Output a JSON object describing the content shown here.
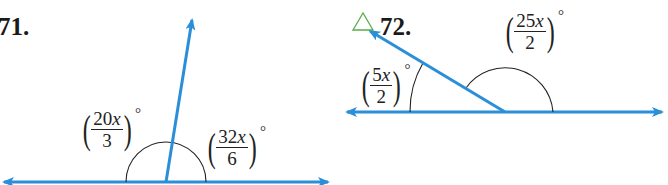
{
  "problems": [
    {
      "number": "71.",
      "flag_icon": "",
      "angles": [
        {
          "numerator_coef": "20",
          "variable": "x",
          "denominator": "3",
          "degree": "°"
        },
        {
          "numerator_coef": "32",
          "variable": "x",
          "denominator": "6",
          "degree": "°"
        }
      ]
    },
    {
      "number": "72.",
      "flag_icon": "△",
      "angles": [
        {
          "numerator_coef": "5",
          "variable": "x",
          "denominator": "2",
          "degree": "°"
        },
        {
          "numerator_coef": "25",
          "variable": "x",
          "denominator": "2",
          "degree": "°"
        }
      ]
    }
  ],
  "colors": {
    "line": "#2a8fd8",
    "arc": "#222222",
    "flag": "#5aab4a",
    "text": "#1a1a1a"
  }
}
